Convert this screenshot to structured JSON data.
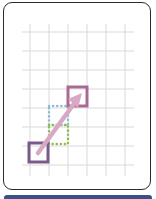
{
  "illustration": {
    "name": "move-resize-grid-illustration",
    "colors": {
      "card_border": "#2b2b2b",
      "grid_line": "#d9d9d9",
      "start_square": "#7a5a8c",
      "end_square": "#a86a92",
      "arrow": "#d8a9c4",
      "blue_dotted": "#8db9d6",
      "green_dotted": "#8cbf4a",
      "footer_bar": "#3c4f86"
    },
    "grid": {
      "vertical_x": [
        30,
        49,
        68,
        87,
        106,
        125
      ],
      "horizontal_y": [
        32,
        51,
        70,
        89,
        108,
        127,
        146,
        165
      ],
      "x_range": [
        22,
        134
      ],
      "y_range": [
        24,
        176
      ]
    },
    "shapes": {
      "start_square": {
        "x": 29,
        "y": 143,
        "w": 19,
        "h": 19
      },
      "end_square": {
        "x": 68,
        "y": 87,
        "w": 19,
        "h": 19
      },
      "blue_rect": {
        "x": 49,
        "y": 106,
        "w": 19,
        "h": 19
      },
      "green_rect": {
        "x": 49,
        "y": 125,
        "w": 19,
        "h": 19
      },
      "arrow": {
        "x1": 38,
        "y1": 153,
        "x2": 80,
        "y2": 96
      }
    }
  }
}
